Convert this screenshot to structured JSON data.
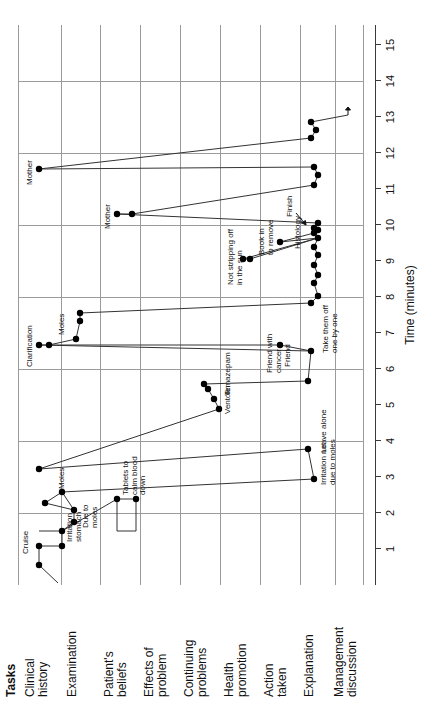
{
  "figure": {
    "tasks_header": "Tasks",
    "x_axis_title": "Time (minutes)",
    "x_ticks": [
      "1",
      "2",
      "3",
      "4",
      "5",
      "6",
      "7",
      "8",
      "9",
      "10",
      "11",
      "12",
      "13",
      "14",
      "15"
    ]
  },
  "rows": [
    {
      "id": "clinical-history",
      "label": "Clinical\nhistory"
    },
    {
      "id": "examination",
      "label": "Examination"
    },
    {
      "id": "patients-beliefs",
      "label": "Patient's\nbeliefs"
    },
    {
      "id": "effects-of-problem",
      "label": "Effects of\nproblem"
    },
    {
      "id": "continuing-problems",
      "label": "Continuing\nproblems"
    },
    {
      "id": "health-promotion",
      "label": "Health\npromotion"
    },
    {
      "id": "action-taken",
      "label": "Action\ntaken"
    },
    {
      "id": "explanation",
      "label": "Explanation"
    },
    {
      "id": "management-discussion",
      "label": "Management\ndiscussion"
    }
  ],
  "annotations": [
    {
      "id": "cruise",
      "text": "Cruise"
    },
    {
      "id": "irritation-stomach",
      "text": "Irritation\nstomach"
    },
    {
      "id": "due-to-moles",
      "text": "Due to\nmoles"
    },
    {
      "id": "moles-exam",
      "text": "Moles"
    },
    {
      "id": "tablets-to-calm-blood-down",
      "text": "Tablets to\ncalm blood\ndown"
    },
    {
      "id": "irritation-not-due-to-moles",
      "text": "Irritation not\ndue to moles"
    },
    {
      "id": "leave-alone",
      "text": "Leave alone"
    },
    {
      "id": "clarification",
      "text": "Clarification"
    },
    {
      "id": "friend-with-cancer",
      "text": "Friend with\ncancer"
    },
    {
      "id": "ventolin",
      "text": "Ventolin"
    },
    {
      "id": "temazepam",
      "text": "Temazepam"
    },
    {
      "id": "moles-mid",
      "text": "Moles"
    },
    {
      "id": "friend",
      "text": "Friend"
    },
    {
      "id": "take-them-off-one-by-one",
      "text": "Take them off\none by one"
    },
    {
      "id": "not-stripping-off-in-the-sun",
      "text": "Not stripping off\nin the sun"
    },
    {
      "id": "book-in-to-remove",
      "text": "Book in\nto remove"
    },
    {
      "id": "histology",
      "text": "Histology"
    },
    {
      "id": "mother-1",
      "text": "Mother"
    },
    {
      "id": "mother-2",
      "text": "Mother"
    },
    {
      "id": "finish",
      "text": "Finish"
    }
  ],
  "chart_data": {
    "type": "line",
    "title": "",
    "xlabel": "Time (minutes)",
    "ylabel": "Tasks",
    "xlim": [
      0,
      15.6
    ],
    "grid": true,
    "legend": "none",
    "categories": [
      "Clinical history",
      "Examination",
      "Patient's beliefs",
      "Effects of problem",
      "Continuing problems",
      "Health promotion",
      "Action taken",
      "Explanation",
      "Management discussion"
    ],
    "points": [
      {
        "t": 0.55,
        "task": "Clinical history",
        "label": ""
      },
      {
        "t": 1.05,
        "task": "Clinical history",
        "label": "Cruise"
      },
      {
        "t": 1.05,
        "task": "Examination",
        "label": "Irritation stomach"
      },
      {
        "t": 1.75,
        "task": "Examination",
        "label": ""
      },
      {
        "t": 2.05,
        "task": "Examination",
        "label": "Due to moles"
      },
      {
        "t": 2.15,
        "task": "Patient's beliefs",
        "label": "Tablets to calm blood down"
      },
      {
        "t": 2.45,
        "task": "Examination",
        "label": "Moles"
      },
      {
        "t": 2.55,
        "task": "Patient's beliefs",
        "label": ""
      },
      {
        "t": 2.75,
        "task": "Explanation",
        "label": "Irritation not due to moles"
      },
      {
        "t": 3.45,
        "task": "Explanation",
        "label": "Leave alone"
      },
      {
        "t": 3.0,
        "task": "Clinical history",
        "label": ""
      },
      {
        "t": 4.55,
        "task": "Continuing problems",
        "label": "Ventolin"
      },
      {
        "t": 4.85,
        "task": "Continuing problems",
        "label": "Temazepam"
      },
      {
        "t": 5.15,
        "task": "Continuing problems",
        "label": ""
      },
      {
        "t": 5.3,
        "task": "Explanation",
        "label": ""
      },
      {
        "t": 6.1,
        "task": "Explanation",
        "label": "Take them off one by one"
      },
      {
        "t": 6.25,
        "task": "Clinical history",
        "label": "Clarification"
      },
      {
        "t": 6.35,
        "task": "Clinical history",
        "label": ""
      },
      {
        "t": 6.4,
        "task": "Examination",
        "label": "Moles"
      },
      {
        "t": 6.25,
        "task": "Action taken",
        "label": "Friend"
      },
      {
        "t": 6.9,
        "task": "Examination",
        "label": ""
      },
      {
        "t": 7.1,
        "task": "Examination",
        "label": ""
      },
      {
        "t": 7.35,
        "task": "Explanation",
        "label": ""
      },
      {
        "t": 7.55,
        "task": "Explanation",
        "label": ""
      },
      {
        "t": 7.9,
        "task": "Explanation",
        "label": ""
      },
      {
        "t": 8.1,
        "task": "Explanation",
        "label": ""
      },
      {
        "t": 8.35,
        "task": "Explanation",
        "label": ""
      },
      {
        "t": 8.55,
        "task": "Explanation",
        "label": ""
      },
      {
        "t": 8.8,
        "task": "Explanation",
        "label": ""
      },
      {
        "t": 9.0,
        "task": "Explanation",
        "label": ""
      },
      {
        "t": 9.15,
        "task": "Health promotion",
        "label": "Not stripping off in the sun"
      },
      {
        "t": 9.3,
        "task": "Health promotion",
        "label": ""
      },
      {
        "t": 9.5,
        "task": "Explanation",
        "label": "Histology"
      },
      {
        "t": 9.7,
        "task": "Explanation",
        "label": ""
      },
      {
        "t": 9.6,
        "task": "Action taken",
        "label": "Book in to remove"
      },
      {
        "t": 9.85,
        "task": "Explanation",
        "label": ""
      },
      {
        "t": 10.0,
        "task": "Explanation",
        "label": "Finish"
      },
      {
        "t": 10.2,
        "task": "Patient's beliefs",
        "label": "Mother"
      },
      {
        "t": 10.35,
        "task": "Patient's beliefs",
        "label": ""
      },
      {
        "t": 11.05,
        "task": "Explanation",
        "label": ""
      },
      {
        "t": 11.35,
        "task": "Explanation",
        "label": ""
      },
      {
        "t": 11.55,
        "task": "Explanation",
        "label": ""
      },
      {
        "t": 11.5,
        "task": "Clinical history",
        "label": "Mother"
      },
      {
        "t": 12.35,
        "task": "Explanation",
        "label": ""
      },
      {
        "t": 12.55,
        "task": "Explanation",
        "label": ""
      },
      {
        "t": 12.75,
        "task": "Explanation",
        "label": ""
      },
      {
        "t": 13.0,
        "task": "Management discussion",
        "label": ""
      }
    ]
  }
}
